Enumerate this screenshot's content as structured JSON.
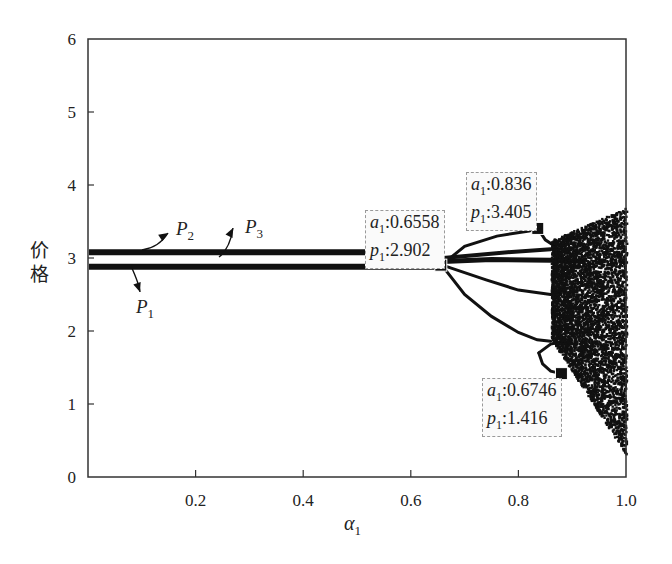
{
  "chart_data": {
    "type": "scatter",
    "subtype": "bifurcation-diagram",
    "title": "",
    "xlabel": "α1",
    "ylabel": "价格",
    "xlim": [
      0.0,
      1.0
    ],
    "ylim": [
      0,
      6
    ],
    "x_ticks": [
      0.2,
      0.4,
      0.6,
      0.8,
      1.0
    ],
    "x_tick_labels": [
      "0.2",
      "0.4",
      "0.6",
      "0.8",
      "1.0"
    ],
    "y_ticks": [
      0,
      1,
      2,
      3,
      4,
      5,
      6
    ],
    "y_tick_labels": [
      "0",
      "1",
      "2",
      "3",
      "4",
      "5",
      "6"
    ],
    "grid": false,
    "legend": null,
    "series": [
      {
        "name": "P1",
        "description": "stable fixed point branch",
        "x_range": [
          0.0,
          0.6558
        ],
        "y": 2.88
      },
      {
        "name": "P2",
        "description": "stable fixed point branch",
        "x_range": [
          0.0,
          0.6558
        ],
        "y": 3.08
      },
      {
        "name": "P3",
        "description": "stable fixed point branch (overlapping)",
        "x_range": [
          0.0,
          0.6558
        ],
        "y": 3.08
      }
    ],
    "bifurcation_points": [
      {
        "label_a": "a1:0.6558",
        "label_p": "p1:2.902",
        "a1": 0.6558,
        "p1": 2.902,
        "type": "period-doubling onset"
      },
      {
        "label_a": "a1:0.836",
        "label_p": "p1:3.405",
        "a1": 0.836,
        "p1": 3.405,
        "type": "period-doubling"
      },
      {
        "label_a": "a1:0.6746",
        "label_p": "p1:1.416",
        "a1": 0.6746,
        "p1": 1.416,
        "type": "period-doubling"
      }
    ],
    "period2_upper_branch": [
      [
        0.6558,
        2.95
      ],
      [
        0.7,
        3.2
      ],
      [
        0.76,
        3.33
      ],
      [
        0.82,
        3.38
      ],
      [
        0.836,
        3.405
      ]
    ],
    "period2_lower_branch": [
      [
        0.6558,
        2.85
      ],
      [
        0.7,
        2.4
      ],
      [
        0.76,
        2.08
      ],
      [
        0.82,
        1.85
      ],
      [
        0.86,
        1.7
      ]
    ],
    "chaos_region": {
      "x_range": [
        0.86,
        1.0
      ],
      "y_range": [
        0.3,
        3.7
      ]
    },
    "annotations": [
      "P1",
      "P2",
      "P3"
    ]
  },
  "labels": {
    "p1": "P",
    "p1_sub": "1",
    "p2": "P",
    "p2_sub": "2",
    "p3": "P",
    "p3_sub": "3",
    "ylabel_line1": "价",
    "ylabel_line2": "格",
    "xlabel_main": "α",
    "xlabel_sub": "1"
  },
  "annotation_boxes": [
    {
      "a_prefix": "a",
      "a_sub": "1",
      "a_value": ":0.6558",
      "p_prefix": "p",
      "p_sub": "1",
      "p_value": ":2.902"
    },
    {
      "a_prefix": "a",
      "a_sub": "1",
      "a_value": ":0.836",
      "p_prefix": "p",
      "p_sub": "1",
      "p_value": ":3.405"
    },
    {
      "a_prefix": "a",
      "a_sub": "1",
      "a_value": ":0.6746",
      "p_prefix": "p",
      "p_sub": "1",
      "p_value": ":1.416"
    }
  ],
  "colors": {
    "ink": "#111111",
    "frame": "#333333",
    "box_border": "#9a9a9a"
  }
}
